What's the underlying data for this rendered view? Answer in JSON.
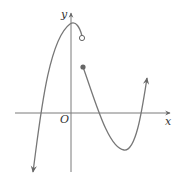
{
  "diagram": {
    "labels": {
      "y_axis": "y",
      "x_axis": "x",
      "origin": "O"
    },
    "colors": {
      "axis": "#7a7a7a",
      "curve": "#777777",
      "filled_point": "#666666",
      "open_point_fill": "#ffffff"
    },
    "points": {
      "open_circle": {
        "x": 82,
        "y": 38,
        "type": "open"
      },
      "filled_circle": {
        "x": 83,
        "y": 67,
        "type": "closed"
      }
    }
  }
}
